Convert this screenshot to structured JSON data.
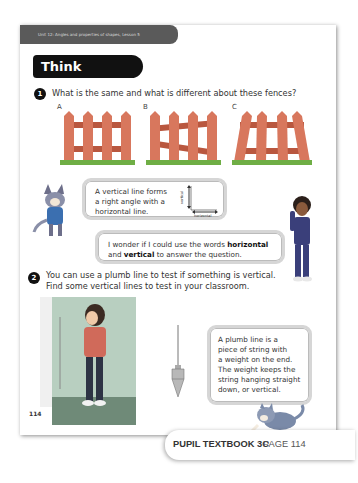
{
  "header": {
    "unit_label": "Unit 12: Angles and properties of shapes, Lesson 5",
    "section_title": "Think together"
  },
  "questions": [
    {
      "number": "1",
      "text": "What is the same and what is different about these fences?",
      "fences": [
        {
          "label": "A",
          "description": "vertical posts, horizontal rails"
        },
        {
          "label": "B",
          "description": "vertical posts, slanted rails"
        },
        {
          "label": "C",
          "description": "leaning posts, horizontal rails"
        }
      ]
    },
    {
      "number": "2",
      "line1": "You can use a plumb line to test if something is vertical.",
      "line2": "Find some vertical lines to test in your classroom."
    }
  ],
  "bubbles": {
    "astrid_line1": "A vertical line forms",
    "astrid_line2": "a right angle with a",
    "astrid_line3": "horizontal line.",
    "diagram_vertical": "vertical",
    "diagram_horizontal": "horizontal",
    "boy_pre": "I wonder if I could use the words ",
    "boy_bold1": "horizontal",
    "boy_mid": "and ",
    "boy_bold2": "vertical",
    "boy_post": " to answer the question.",
    "plumb_line1": "A plumb line is a",
    "plumb_line2": "piece of string with",
    "plumb_line3": "a weight on the end.",
    "plumb_line4": "The weight keeps the",
    "plumb_line5": "string hanging straight",
    "plumb_line6": "down, or vertical."
  },
  "page_number": "114",
  "footer": {
    "book": "PUPIL TEXTBOOK 3C",
    "page": "PAGE 114"
  },
  "colors": {
    "fence": "#d8775d",
    "fence_dark": "#b9573f",
    "grass": "#6fae45",
    "header_bar": "#5a5a5a",
    "title_bg": "#111111"
  }
}
